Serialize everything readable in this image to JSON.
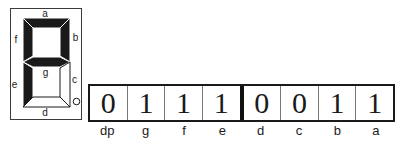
{
  "display": {
    "on_color": "#1a1a1a",
    "off_color": "#ffffff",
    "outline_color": "#3a3a3a",
    "segments": {
      "a": {
        "label": "a",
        "state": "on"
      },
      "b": {
        "label": "b",
        "state": "on"
      },
      "c": {
        "label": "c",
        "state": "off"
      },
      "d": {
        "label": "d",
        "state": "off"
      },
      "e": {
        "label": "e",
        "state": "on"
      },
      "f": {
        "label": "f",
        "state": "on"
      },
      "g": {
        "label": "g",
        "state": "on"
      },
      "dp": {
        "state": "off"
      }
    }
  },
  "register_table": {
    "bits": [
      {
        "value": "0",
        "label": "dp"
      },
      {
        "value": "1",
        "label": "g"
      },
      {
        "value": "1",
        "label": "f"
      },
      {
        "value": "1",
        "label": "e"
      },
      {
        "value": "0",
        "label": "d"
      },
      {
        "value": "0",
        "label": "c"
      },
      {
        "value": "1",
        "label": "b"
      },
      {
        "value": "1",
        "label": "a"
      }
    ]
  }
}
